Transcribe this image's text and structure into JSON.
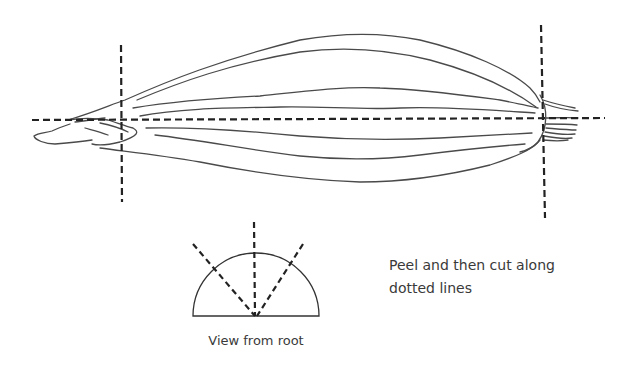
{
  "diagram": {
    "labels": {
      "instruction_line1": "Peel and then cut along",
      "instruction_line2": "dotted lines",
      "view_caption": "View from root"
    },
    "colors": {
      "stroke": "#4a4a4a",
      "dashed": "#222222",
      "text": "#3a3a3a",
      "background": "#ffffff"
    },
    "cut_lines": {
      "horizontal": {
        "x1": 32,
        "y1": 120,
        "x2": 605,
        "y2": 118
      },
      "left_vertical": {
        "x1": 121,
        "y1": 45,
        "x2": 122,
        "y2": 202
      },
      "right_vertical": {
        "x1": 541,
        "y1": 25,
        "x2": 545,
        "y2": 218
      }
    },
    "root_view": {
      "center": [
        255,
        316
      ],
      "radius": 63,
      "cut_angles_deg": [
        50,
        90,
        130
      ]
    }
  }
}
